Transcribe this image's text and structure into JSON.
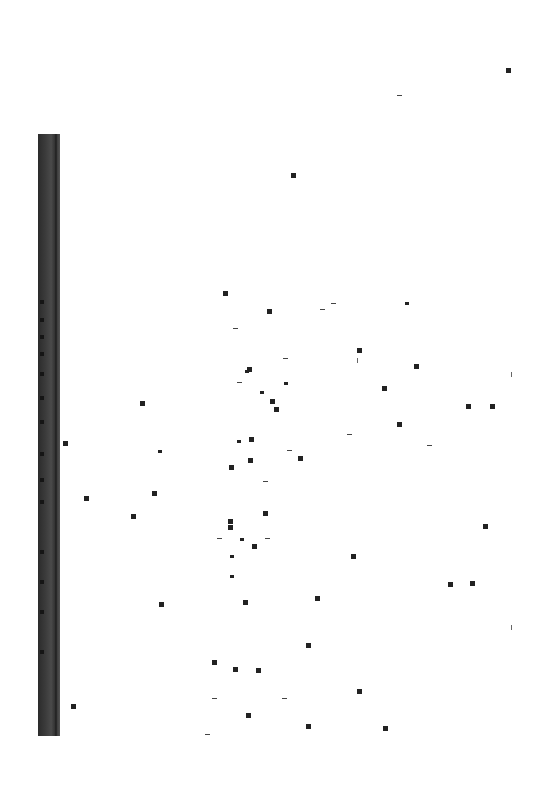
{
  "document": {
    "type": "scanned-blank-page",
    "background_color": "#ffffff",
    "binding_strip_color": "#3a3a3a",
    "visible_text": []
  },
  "specks": [
    {
      "x": 506,
      "y": 68,
      "k": "sq"
    },
    {
      "x": 397,
      "y": 95,
      "k": "dash"
    },
    {
      "x": 291,
      "y": 173,
      "k": "sq"
    },
    {
      "x": 223,
      "y": 291,
      "k": "sq"
    },
    {
      "x": 267,
      "y": 309,
      "k": "sq"
    },
    {
      "x": 320,
      "y": 309,
      "k": "dash"
    },
    {
      "x": 331,
      "y": 303,
      "k": "dash"
    },
    {
      "x": 405,
      "y": 302,
      "k": "sm"
    },
    {
      "x": 233,
      "y": 328,
      "k": "dash"
    },
    {
      "x": 357,
      "y": 348,
      "k": "sq"
    },
    {
      "x": 357,
      "y": 358,
      "k": "vt"
    },
    {
      "x": 283,
      "y": 358,
      "k": "dash"
    },
    {
      "x": 414,
      "y": 364,
      "k": "sq"
    },
    {
      "x": 247,
      "y": 367,
      "k": "sq"
    },
    {
      "x": 245,
      "y": 370,
      "k": "sm"
    },
    {
      "x": 511,
      "y": 372,
      "k": "vt"
    },
    {
      "x": 237,
      "y": 382,
      "k": "dash"
    },
    {
      "x": 284,
      "y": 382,
      "k": "sm"
    },
    {
      "x": 382,
      "y": 386,
      "k": "sq"
    },
    {
      "x": 260,
      "y": 391,
      "k": "sm"
    },
    {
      "x": 140,
      "y": 401,
      "k": "sq"
    },
    {
      "x": 270,
      "y": 399,
      "k": "sq"
    },
    {
      "x": 274,
      "y": 407,
      "k": "sq"
    },
    {
      "x": 466,
      "y": 404,
      "k": "sq"
    },
    {
      "x": 490,
      "y": 404,
      "k": "sq"
    },
    {
      "x": 397,
      "y": 422,
      "k": "sq"
    },
    {
      "x": 347,
      "y": 434,
      "k": "dash"
    },
    {
      "x": 63,
      "y": 441,
      "k": "sq"
    },
    {
      "x": 237,
      "y": 440,
      "k": "sm"
    },
    {
      "x": 249,
      "y": 437,
      "k": "sq"
    },
    {
      "x": 158,
      "y": 450,
      "k": "sm"
    },
    {
      "x": 427,
      "y": 445,
      "k": "dash"
    },
    {
      "x": 287,
      "y": 450,
      "k": "dash"
    },
    {
      "x": 298,
      "y": 456,
      "k": "sq"
    },
    {
      "x": 248,
      "y": 458,
      "k": "sq"
    },
    {
      "x": 229,
      "y": 465,
      "k": "sq"
    },
    {
      "x": 263,
      "y": 481,
      "k": "dash"
    },
    {
      "x": 84,
      "y": 496,
      "k": "sq"
    },
    {
      "x": 152,
      "y": 491,
      "k": "sq"
    },
    {
      "x": 263,
      "y": 511,
      "k": "sq"
    },
    {
      "x": 131,
      "y": 514,
      "k": "sq"
    },
    {
      "x": 483,
      "y": 524,
      "k": "sq"
    },
    {
      "x": 228,
      "y": 519,
      "k": "sq"
    },
    {
      "x": 228,
      "y": 525,
      "k": "sq"
    },
    {
      "x": 217,
      "y": 538,
      "k": "dash"
    },
    {
      "x": 240,
      "y": 538,
      "k": "sm"
    },
    {
      "x": 265,
      "y": 538,
      "k": "dash"
    },
    {
      "x": 252,
      "y": 544,
      "k": "sq"
    },
    {
      "x": 230,
      "y": 555,
      "k": "sm"
    },
    {
      "x": 351,
      "y": 554,
      "k": "sq"
    },
    {
      "x": 230,
      "y": 575,
      "k": "sm"
    },
    {
      "x": 448,
      "y": 582,
      "k": "sq"
    },
    {
      "x": 470,
      "y": 581,
      "k": "sq"
    },
    {
      "x": 315,
      "y": 596,
      "k": "sq"
    },
    {
      "x": 159,
      "y": 602,
      "k": "sq"
    },
    {
      "x": 243,
      "y": 600,
      "k": "sq"
    },
    {
      "x": 511,
      "y": 625,
      "k": "vt"
    },
    {
      "x": 306,
      "y": 643,
      "k": "sq"
    },
    {
      "x": 212,
      "y": 660,
      "k": "sq"
    },
    {
      "x": 233,
      "y": 667,
      "k": "sq"
    },
    {
      "x": 256,
      "y": 668,
      "k": "sq"
    },
    {
      "x": 357,
      "y": 689,
      "k": "sq"
    },
    {
      "x": 212,
      "y": 698,
      "k": "dash"
    },
    {
      "x": 282,
      "y": 698,
      "k": "dash"
    },
    {
      "x": 71,
      "y": 704,
      "k": "sq"
    },
    {
      "x": 246,
      "y": 713,
      "k": "sq"
    },
    {
      "x": 306,
      "y": 724,
      "k": "sq"
    },
    {
      "x": 383,
      "y": 726,
      "k": "sq"
    },
    {
      "x": 205,
      "y": 734,
      "k": "dash"
    }
  ],
  "spine_marks": [
    300,
    318,
    335,
    352,
    372,
    396,
    420,
    452,
    478,
    500,
    550,
    580,
    610,
    650
  ]
}
